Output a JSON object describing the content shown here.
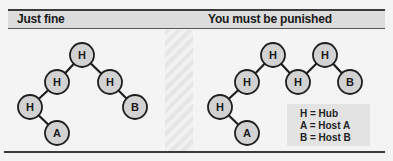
{
  "panels": [
    {
      "title": "Just fine",
      "nodes": [
        {
          "label": "H",
          "x": 82,
          "y": 55
        },
        {
          "label": "H",
          "x": 57,
          "y": 82
        },
        {
          "label": "H",
          "x": 110,
          "y": 82
        },
        {
          "label": "H",
          "x": 30,
          "y": 107
        },
        {
          "label": "A",
          "x": 57,
          "y": 133
        },
        {
          "label": "B",
          "x": 135,
          "y": 107
        }
      ],
      "edges": [
        [
          0,
          1
        ],
        [
          0,
          2
        ],
        [
          1,
          3
        ],
        [
          3,
          4
        ],
        [
          2,
          5
        ]
      ]
    },
    {
      "title": "You must be punished",
      "nodes": [
        {
          "label": "H",
          "x": 273,
          "y": 55
        },
        {
          "label": "H",
          "x": 325,
          "y": 55
        },
        {
          "label": "H",
          "x": 247,
          "y": 82
        },
        {
          "label": "H",
          "x": 298,
          "y": 82
        },
        {
          "label": "B",
          "x": 350,
          "y": 82
        },
        {
          "label": "H",
          "x": 220,
          "y": 107
        },
        {
          "label": "A",
          "x": 247,
          "y": 133
        }
      ],
      "edges": [
        [
          0,
          2
        ],
        [
          0,
          3
        ],
        [
          3,
          1
        ],
        [
          1,
          4
        ],
        [
          2,
          5
        ],
        [
          5,
          6
        ]
      ]
    }
  ],
  "legend": {
    "items": [
      "H = Hub",
      "A = Host A",
      "B = Host B"
    ]
  },
  "colors": {
    "node_fill": "#d2d2d2",
    "node_stroke": "#1e1e1e",
    "edge": "#1e1e1e",
    "header_bg": "#dcdcdc"
  }
}
